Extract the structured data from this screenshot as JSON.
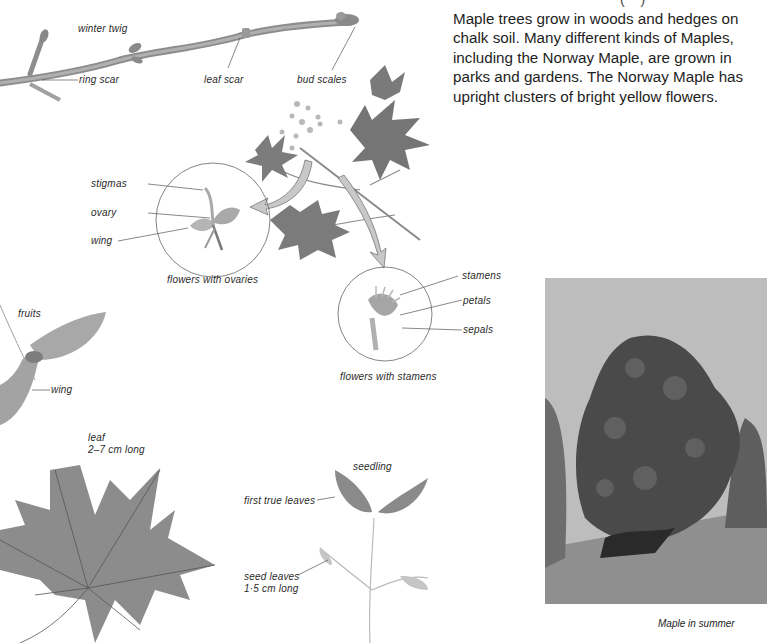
{
  "page": {
    "top_fragment": "(   )",
    "body_paragraph": "Maple trees grow in woods and hedges on chalk soil. Many different kinds of Maples, including the Norway Maple, are grown in parks and gardens. The Norway Maple has upright clusters of bright yellow flowers."
  },
  "twig": {
    "title": "winter twig",
    "labels": {
      "ring_scar": "ring scar",
      "leaf_scar": "leaf scar",
      "bud_scales": "bud scales"
    }
  },
  "female_flower": {
    "caption": "flowers with ovaries",
    "labels": {
      "stigmas": "stigmas",
      "ovary": "ovary",
      "wing": "wing"
    }
  },
  "male_flower": {
    "caption": "flowers with stamens",
    "labels": {
      "stamens": "stamens",
      "petals": "petals",
      "sepals": "sepals"
    }
  },
  "fruits": {
    "title": "fruits",
    "wing": "wing"
  },
  "leaf": {
    "title": "leaf",
    "size": "2–7 cm long"
  },
  "seedling": {
    "title": "seedling",
    "first_true_leaves": "first true leaves",
    "seed_leaves": "seed leaves",
    "seed_leaves_size": "1·5 cm long"
  },
  "photo": {
    "caption": "Maple in summer"
  },
  "colors": {
    "background": "#ffffff",
    "text": "#222222",
    "illustration_gray": "#7a7a7a",
    "arrow_fill": "#c8c8c8"
  }
}
